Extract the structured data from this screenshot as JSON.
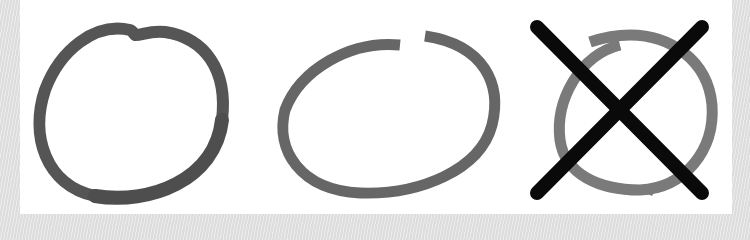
{
  "figure": {
    "items": [
      {
        "name": "circle-closed",
        "label": "",
        "stroke": "#555555"
      },
      {
        "name": "circle-open-gap",
        "label": "",
        "stroke": "#6a6a6a"
      },
      {
        "name": "circle-spiral-crossed",
        "label": "",
        "stroke": "#7a7a7a",
        "cross_color": "#0a0a0a"
      }
    ],
    "colors": {
      "background": "#e4e4e4",
      "panel": "#ffffff"
    }
  }
}
